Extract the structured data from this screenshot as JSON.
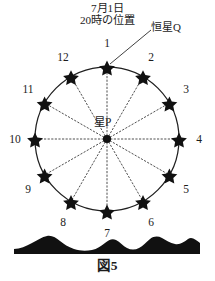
{
  "figure": {
    "caption": "図5",
    "header_note": {
      "line1": "7月1日",
      "line2": "20時の位置"
    },
    "labels": {
      "star_q": "恒星Q",
      "center_star_p": "星P"
    },
    "colors": {
      "ink": "#1a1a1a",
      "circle_stroke": "#1f1f1f",
      "dotted_ray": "#3a3a3a",
      "horizon_fill": "#111111",
      "background": "#ffffff"
    },
    "geometry": {
      "center_x": 107,
      "center_y": 139,
      "circle_radius": 72,
      "star_radius": 6.4,
      "label_radius": 87,
      "num_positions": 12
    },
    "positions": [
      {
        "num": "1",
        "angle_deg": 0,
        "label_x": 107,
        "label_y": 43
      },
      {
        "num": "2",
        "angle_deg": 30,
        "label_x": 151,
        "label_y": 57
      },
      {
        "num": "3",
        "angle_deg": 60,
        "label_x": 186,
        "label_y": 89
      },
      {
        "num": "4",
        "angle_deg": 90,
        "label_x": 199,
        "label_y": 139
      },
      {
        "num": "5",
        "angle_deg": 120,
        "label_x": 186,
        "label_y": 189
      },
      {
        "num": "6",
        "angle_deg": 150,
        "label_x": 151,
        "label_y": 222
      },
      {
        "num": "7",
        "angle_deg": 180,
        "label_x": 107,
        "label_y": 233
      },
      {
        "num": "8",
        "angle_deg": 210,
        "label_x": 63,
        "label_y": 222
      },
      {
        "num": "9",
        "angle_deg": 240,
        "label_x": 28,
        "label_y": 189
      },
      {
        "num": "10",
        "angle_deg": 270,
        "label_x": 15,
        "label_y": 139
      },
      {
        "num": "11",
        "angle_deg": 300,
        "label_x": 28,
        "label_y": 89
      },
      {
        "num": "12",
        "angle_deg": 330,
        "label_x": 63,
        "label_y": 57
      }
    ],
    "horizon": {
      "description": "mountain-silhouette",
      "path": "M 14 254 L 14 249 C 20 249 26 246 32 243 C 38 240 42 237 47 236 C 52 235 56 238 60 241 C 64 244 68 247 74 249 C 80 251 86 251 92 250 C 97 249 101 246 105 243 C 109 240 112 238 116 240 C 120 242 123 246 127 248 C 131 250 135 250 139 248 C 143 246 146 242 150 239 C 154 236 158 236 162 238 C 166 240 170 243 175 244 C 180 245 184 242 188 239 C 192 236 196 240 200 243 L 200 254 Z"
    }
  }
}
